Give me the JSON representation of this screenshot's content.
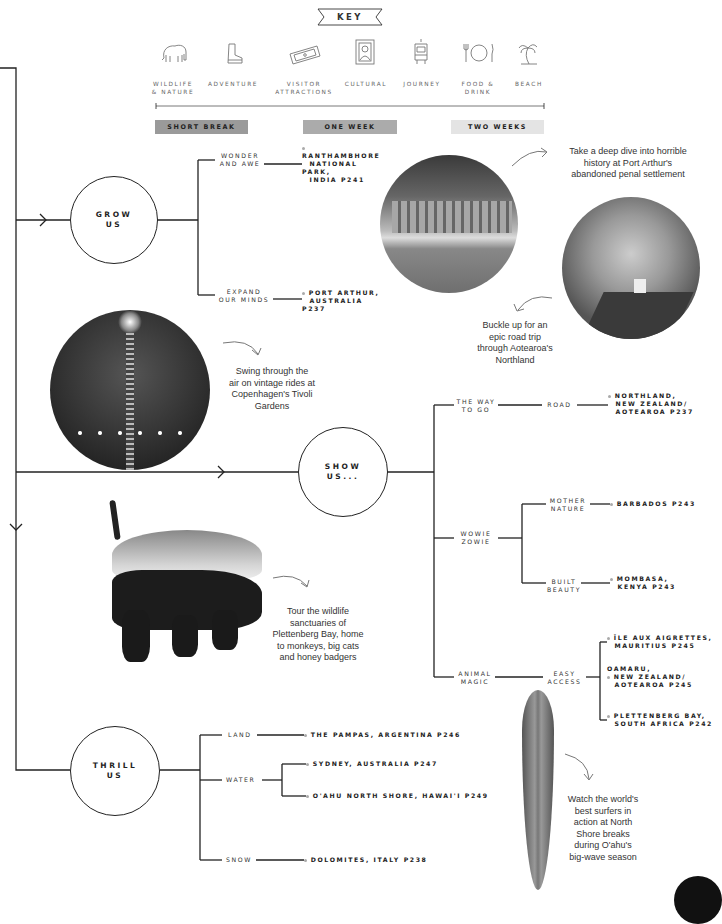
{
  "key": {
    "title": "KEY",
    "categories": [
      {
        "icon": "elephant-icon",
        "label_line1": "WILDLIFE",
        "label_line2": "& NATURE"
      },
      {
        "icon": "boot-icon",
        "label_line1": "ADVENTURE",
        "label_line2": ""
      },
      {
        "icon": "ticket-icon",
        "label_line1": "VISITOR",
        "label_line2": "ATTRACTIONS"
      },
      {
        "icon": "framed-portrait-icon",
        "label_line1": "CULTURAL",
        "label_line2": ""
      },
      {
        "icon": "tram-icon",
        "label_line1": "JOURNEY",
        "label_line2": ""
      },
      {
        "icon": "plate-cutlery-icon",
        "label_line1": "FOOD &",
        "label_line2": "DRINK"
      },
      {
        "icon": "palm-tree-icon",
        "label_line1": "BEACH",
        "label_line2": ""
      }
    ],
    "durations": [
      {
        "label": "SHORT BREAK",
        "color": "#9a9a9a"
      },
      {
        "label": "ONE WEEK",
        "color": "#ababab"
      },
      {
        "label": "TWO WEEKS",
        "color": "#e4e4e4"
      }
    ]
  },
  "grow": {
    "node": {
      "line1": "GROW",
      "line2": "US"
    },
    "branches": [
      {
        "label_line1": "WONDER",
        "label_line2": "AND AWE",
        "dest": [
          "RANTHAMBHORE",
          "NATIONAL PARK,",
          "INDIA P241"
        ]
      },
      {
        "label_line1": "EXPAND",
        "label_line2": "OUR MINDS",
        "dest": [
          "PORT ARTHUR,",
          "AUSTRALIA P237"
        ]
      }
    ]
  },
  "show": {
    "node": {
      "line1": "SHOW",
      "line2": "US..."
    },
    "way": {
      "label_line1": "THE WAY",
      "label_line2": "TO GO",
      "sub": "ROAD",
      "dest": [
        "NORTHLAND,",
        "NEW ZEALAND/",
        "AOTEAROA P237"
      ]
    },
    "wowie": {
      "label_line1": "WOWIE",
      "label_line2": "ZOWIE",
      "subs": [
        {
          "label_line1": "MOTHER",
          "label_line2": "NATURE",
          "dest": [
            "BARBADOS P243"
          ]
        },
        {
          "label_line1": "BUILT",
          "label_line2": "BEAUTY",
          "dest": [
            "MOMBASA,",
            "KENYA P243"
          ]
        }
      ]
    },
    "animal": {
      "label_line1": "ANIMAL",
      "label_line2": "MAGIC",
      "sub_line1": "EASY",
      "sub_line2": "ACCESS",
      "dests": [
        [
          "ÎLE AUX AIGRETTES,",
          "MAURITIUS P245"
        ],
        [
          "OAMARU,",
          "NEW ZEALAND/",
          "AOTEAROA P245"
        ],
        [
          "PLETTENBERG BAY,",
          "SOUTH AFRICA P242"
        ]
      ]
    }
  },
  "thrill": {
    "node": {
      "line1": "THRILL",
      "line2": "US"
    },
    "land": {
      "label": "LAND",
      "dest": "THE PAMPAS, ARGENTINA P246"
    },
    "water": {
      "label": "WATER",
      "dests": [
        "SYDNEY, AUSTRALIA P247",
        "O'AHU NORTH SHORE, HAWAI'I P249"
      ]
    },
    "snow": {
      "label": "SNOW",
      "dest": "DOLOMITES, ITALY P238"
    }
  },
  "blurbs": {
    "port_arthur": [
      "Take a deep dive into horrible",
      "history at Port Arthur's",
      "abandoned penal settlement"
    ],
    "northland": [
      "Buckle up for an",
      "epic road trip",
      "through Aotearoa's",
      "Northland"
    ],
    "tivoli": [
      "Swing through the",
      "air on vintage rides at",
      "Copenhagen's Tivoli",
      "Gardens"
    ],
    "plettenberg": [
      "Tour the wildlife",
      "sanctuaries of",
      "Plettenberg Bay, home",
      "to monkeys, big cats",
      "and honey badgers"
    ],
    "oahu": [
      "Watch the world's",
      "best surfers in",
      "action at North",
      "Shore breaks",
      "during O'ahu's",
      "big-wave season"
    ]
  },
  "photos": {
    "port_arthur": "port-arthur-ruins-photo",
    "northland": "northland-road-photo",
    "tivoli": "tivoli-ride-photo",
    "badger": "honey-badger-photo",
    "surfboard": "surfboard-photo"
  }
}
